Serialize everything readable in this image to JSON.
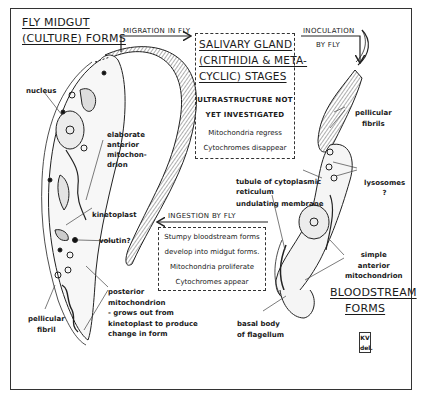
{
  "diagram": {
    "stages": {
      "midgut": {
        "title_line1": "FLY MIDGUT",
        "title_line2": "(CULTURE) FORMS"
      },
      "salivary": {
        "title_line1": "SALIVARY GLAND",
        "title_line2": "(CRITHIDIA & META-",
        "title_line3": "CYCLIC) STAGES",
        "notes": [
          "ULTRASTRUCTURE NOT",
          "YET INVESTIGATED",
          "Mitochondria regress",
          "Cytochromes disappear"
        ]
      },
      "bloodstream": {
        "title_line1": "BLOODSTREAM",
        "title_line2": "FORMS"
      }
    },
    "transitions": {
      "migration": "MIGRATION IN FLY",
      "inoculation_line1": "INOCULATION",
      "inoculation_line2": "BY FLY",
      "ingestion": "INGESTION BY FLY",
      "ingestion_notes": [
        "Stumpy bloodstream forms",
        "develop into midgut forms.",
        "Mitochondria proliferate",
        "Cytochromes appear"
      ]
    },
    "midgut_labels": {
      "nucleus": "nucleus",
      "anterior_mito": [
        "elaborate",
        "anterior",
        "mitochon-",
        "drion"
      ],
      "kinetoplast": "kinetoplast",
      "volutin": "volutin?",
      "posterior_mito": [
        "posterior",
        "mitochondrion",
        "- grows out from",
        "kinetoplast to produce",
        "change in form"
      ],
      "pellicular_fibril": [
        "pellicular",
        "fibril"
      ]
    },
    "bloodstream_labels": {
      "pellicular_fibrils": [
        "pellicular",
        "fibrils"
      ],
      "tubule": [
        "tubule of cytoplasmic",
        "reticulum"
      ],
      "lysosomes": [
        "lysosomes",
        "?"
      ],
      "undulating_membrane": "undulating membrane",
      "simple_mito": [
        "simple",
        "anterior",
        "mitochondrion"
      ],
      "basal_body": [
        "basal body",
        "of flagellum"
      ]
    },
    "signature": {
      "line1": "KV",
      "line2": "del."
    }
  }
}
